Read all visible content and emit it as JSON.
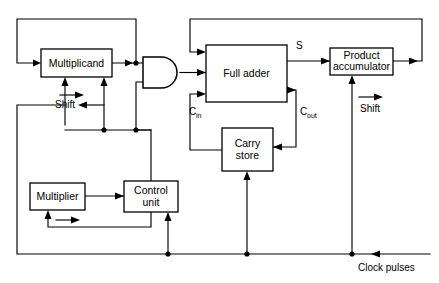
{
  "figure": {
    "background_color": "#ffffff",
    "line_color": "#000000",
    "width": 439,
    "height": 283
  },
  "blocks": [
    {
      "id": "multiplicand",
      "label": "Multiplicand",
      "x": 41,
      "y": 49,
      "w": 71,
      "h": 28
    },
    {
      "id": "full-adder",
      "label": "Full adder",
      "x": 206,
      "y": 45,
      "w": 81,
      "h": 57
    },
    {
      "id": "product-accumulator",
      "line1": "Product",
      "line2": "accumulator",
      "x": 330,
      "y": 48,
      "w": 63,
      "h": 27
    },
    {
      "id": "carry-store",
      "line1": "Carry",
      "line2": "store",
      "x": 222,
      "y": 128,
      "w": 51,
      "h": 43
    },
    {
      "id": "multiplier",
      "label": "Multiplier",
      "x": 30,
      "y": 183,
      "w": 55,
      "h": 27
    },
    {
      "id": "control-unit",
      "line1": "Control",
      "line2": "unit",
      "x": 124,
      "y": 181,
      "w": 54,
      "h": 31
    }
  ],
  "gate": {
    "id": "and-gate",
    "type": "AND",
    "x": 143,
    "y": 57,
    "w": 37,
    "h": 31
  },
  "annotations": [
    {
      "id": "shift-multiplicand",
      "text": "Shift",
      "x": 65,
      "y": 108
    },
    {
      "id": "shift-accumulator",
      "text": "Shift",
      "x": 370,
      "y": 112
    },
    {
      "id": "sum-output",
      "text": "S",
      "x": 299,
      "y": 49
    },
    {
      "id": "carry-in",
      "text": "C",
      "sub": "in",
      "x": 190,
      "y": 115
    },
    {
      "id": "carry-out",
      "text": "C",
      "sub": "out",
      "x": 301,
      "y": 115
    },
    {
      "id": "clock-pulses",
      "text": "Clock pulses",
      "x": 359,
      "y": 271
    }
  ],
  "signal_flow": {
    "multiplicand_to_gate": "Multiplicand output feeds AND gate input",
    "gate_to_adder": "AND gate output feeds Full adder",
    "adder_sum_to_accumulator": "S feeds Product accumulator",
    "adder_carry_to_store": "C_out feeds Carry store",
    "store_to_adder": "Carry store feeds C_in of Full adder",
    "accumulator_feedback": "Product accumulator recirculates to Full adder",
    "multiplicand_feedback": "Multiplicand recirculates to its own input",
    "multiplier_to_control": "Multiplier feeds Control unit",
    "control_to_gate": "Control unit gates the AND gate",
    "clock_distribution": "Clock pulses drive Multiplier, Control unit and Carry store"
  }
}
